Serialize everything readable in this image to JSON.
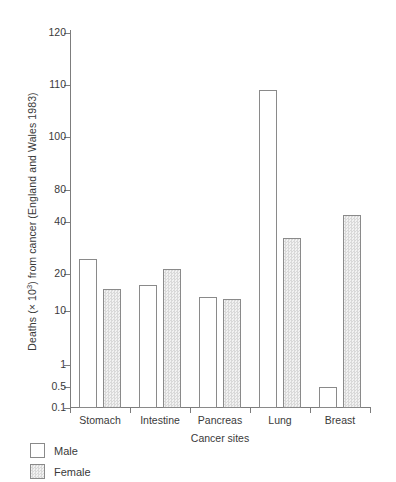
{
  "chart_data": {
    "type": "bar",
    "title": "",
    "xlabel": "Cancer sites",
    "ylabel": "Deaths (× 10³) from cancer (England and Wales 1983)",
    "ylabel_prefix": "Deaths (× 10",
    "ylabel_exponent": "3",
    "ylabel_suffix": ") from cancer (England and Wales 1983)",
    "categories": [
      "Stomach",
      "Intestine",
      "Pancreas",
      "Lung",
      "Breast"
    ],
    "series": [
      {
        "name": "Male",
        "values": [
          24.5,
          16.2,
          13.0,
          109.0,
          0.5
        ]
      },
      {
        "name": "Female",
        "values": [
          15.0,
          21.5,
          12.5,
          32.5,
          47.0
        ]
      }
    ],
    "ytick_labels": [
      "120",
      "110",
      "100",
      "80",
      "40",
      "20",
      "10",
      "1",
      "0.5",
      "0.1"
    ],
    "ytick_values": [
      120,
      110,
      100,
      80,
      40,
      20,
      10,
      1,
      0.5,
      0.1
    ],
    "ylim": [
      0.1,
      124
    ],
    "grid": false,
    "legend_position": "below-left",
    "axis_scale": "piecewise-log",
    "units": "thousands of deaths",
    "region": "England and Wales",
    "year": "1983"
  },
  "legend": {
    "entries": [
      {
        "label": "Male",
        "swatch": "open-square"
      },
      {
        "label": "Female",
        "swatch": "hatched-square"
      }
    ]
  },
  "colors": {
    "axis": "#7d7d7d",
    "text": "#3a3a3a",
    "bar_outline": "#8a8a8a",
    "male_fill": "#ffffff",
    "female_fill": "#dcdcdc",
    "background": "#ffffff"
  }
}
